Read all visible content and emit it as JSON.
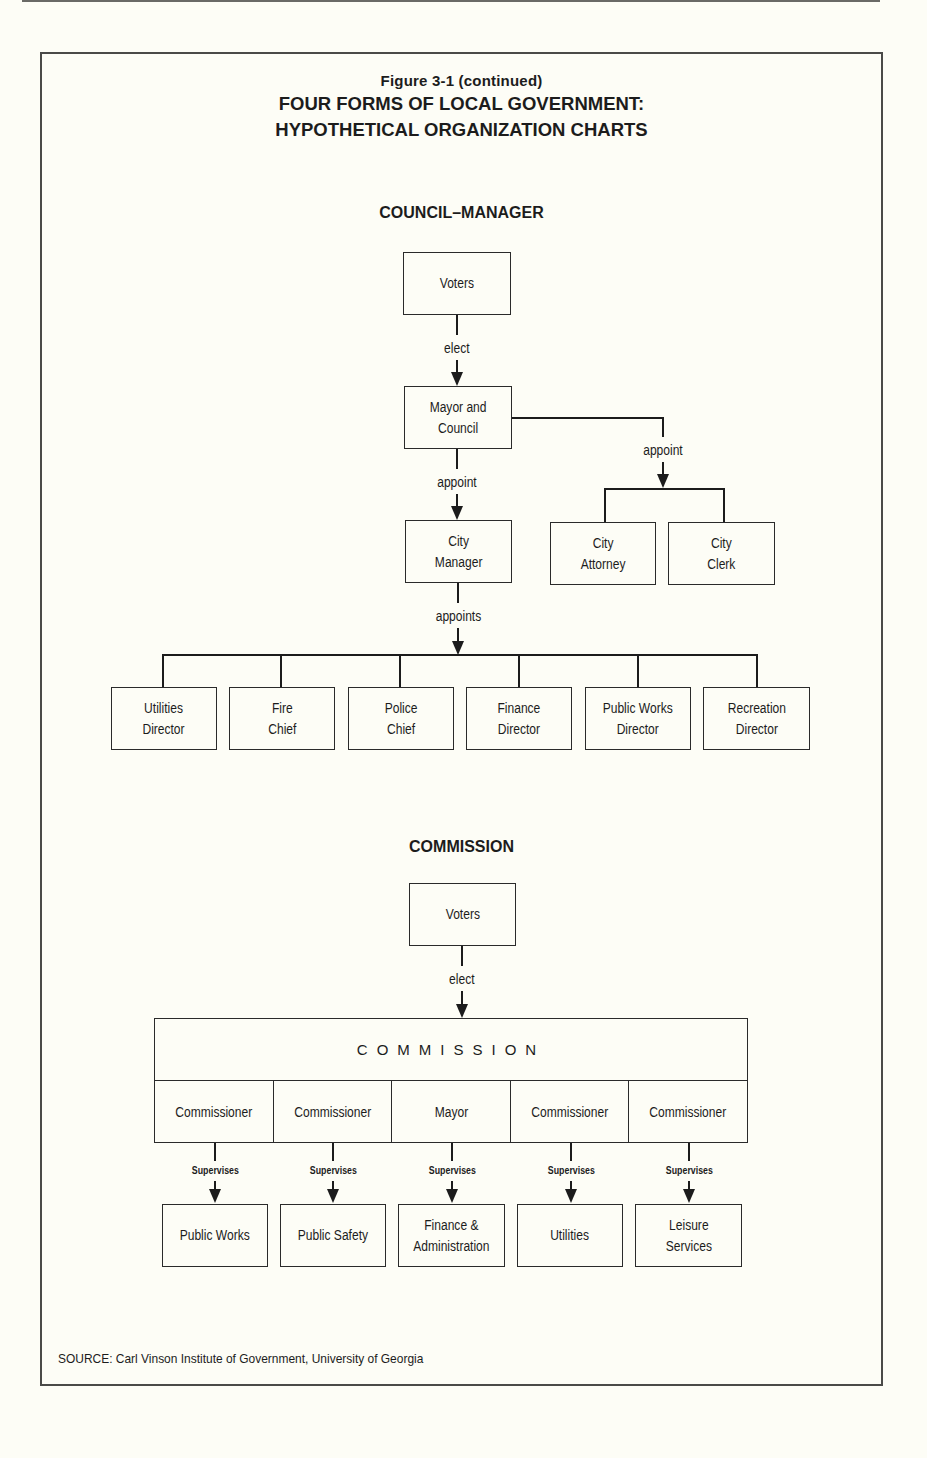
{
  "figure": {
    "label": "Figure 3-1 (continued)",
    "title_line1": "FOUR FORMS OF LOCAL GOVERNMENT:",
    "title_line2": "HYPOTHETICAL ORGANIZATION CHARTS"
  },
  "council_manager": {
    "section_title": "COUNCIL–MANAGER",
    "voters": "Voters",
    "elect_label": "elect",
    "mayor_council": "Mayor and\nCouncil",
    "appoint_left_label": "appoint",
    "appoint_right_label": "appoint",
    "city_manager": "City\nManager",
    "city_attorney": "City\nAttorney",
    "city_clerk": "City\nClerk",
    "appoints_label": "appoints",
    "directors": [
      "Utilities\nDirector",
      "Fire\nChief",
      "Police\nChief",
      "Finance\nDirector",
      "Public Works\nDirector",
      "Recreation\nDirector"
    ]
  },
  "commission": {
    "section_title": "COMMISSION",
    "voters": "Voters",
    "elect_label": "elect",
    "body_name": "COMMISSION",
    "members": [
      "Commissioner",
      "Commissioner",
      "Mayor",
      "Commissioner",
      "Commissioner"
    ],
    "supervises_label": "Supervises",
    "departments": [
      "Public Works",
      "Public Safety",
      "Finance &\nAdministration",
      "Utilities",
      "Leisure\nServices"
    ]
  },
  "source": "SOURCE: Carl Vinson Institute of Government, University of Georgia"
}
